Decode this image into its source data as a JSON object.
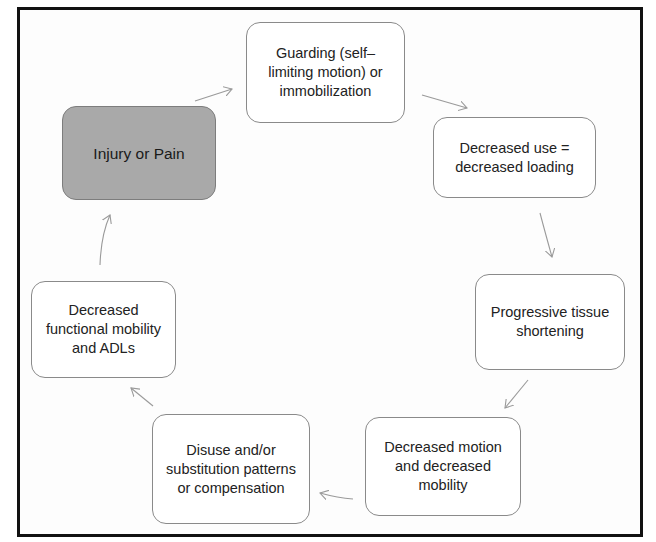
{
  "diagram": {
    "type": "cycle",
    "frame_color": "#111111",
    "nodes": [
      {
        "id": "injury",
        "label": "Injury or Pain",
        "fill": "#a9a9a9"
      },
      {
        "id": "guarding",
        "label": "Guarding (self–limiting motion) or immobilization",
        "fill": "#ffffff"
      },
      {
        "id": "decreased-use",
        "label": "Decreased use = decreased loading",
        "fill": "#ffffff"
      },
      {
        "id": "tissue-shortening",
        "label": "Progressive tissue shortening",
        "fill": "#ffffff"
      },
      {
        "id": "decreased-motion",
        "label": "Decreased motion and decreased mobility",
        "fill": "#ffffff"
      },
      {
        "id": "disuse",
        "label": "Disuse and/or substitution patterns or compensation",
        "fill": "#ffffff"
      },
      {
        "id": "functional-mobility",
        "label": "Decreased functional mobility and ADLs",
        "fill": "#ffffff"
      }
    ],
    "edges": [
      {
        "from": "injury",
        "to": "guarding"
      },
      {
        "from": "guarding",
        "to": "decreased-use"
      },
      {
        "from": "decreased-use",
        "to": "tissue-shortening"
      },
      {
        "from": "tissue-shortening",
        "to": "decreased-motion"
      },
      {
        "from": "decreased-motion",
        "to": "disuse"
      },
      {
        "from": "disuse",
        "to": "functional-mobility"
      },
      {
        "from": "functional-mobility",
        "to": "injury"
      }
    ],
    "arrow_color": "#9a9a9a"
  }
}
